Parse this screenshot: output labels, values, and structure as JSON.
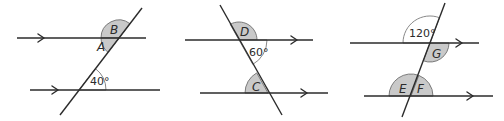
{
  "colors": {
    "line": "#2b2b2b",
    "shaded_sector": "#c9c9c9",
    "sector_outline": "#6e6e6e"
  },
  "diagrams": [
    {
      "id": "diagram-1",
      "unknown_angles": [
        "A",
        "B"
      ],
      "given_angle": "40°",
      "labels": {
        "a": "A",
        "b": "B",
        "given": "40°"
      }
    },
    {
      "id": "diagram-2",
      "unknown_angles": [
        "C",
        "D"
      ],
      "given_angle": "60°",
      "labels": {
        "c": "C",
        "d": "D",
        "given": "60°"
      }
    },
    {
      "id": "diagram-3",
      "unknown_angles": [
        "E",
        "F",
        "G"
      ],
      "given_angle": "120°",
      "labels": {
        "e": "E",
        "f": "F",
        "g": "G",
        "given": "120°"
      }
    }
  ]
}
